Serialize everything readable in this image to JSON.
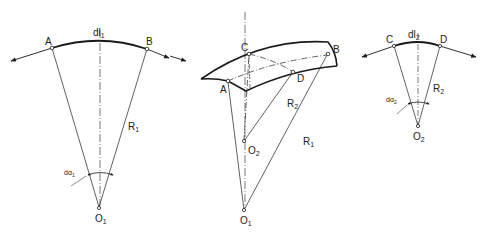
{
  "diagram": {
    "colors": {
      "line": "#3a3a3a",
      "bold": "#1a1a1a",
      "background": "#ffffff"
    },
    "left_figure": {
      "points": {
        "A": "A",
        "B": "B",
        "O": "O",
        "O_sub": "1"
      },
      "arc_label": "dl",
      "arc_label_sub": "1",
      "radius_label": "R",
      "radius_label_sub": "1",
      "angle_label": "dα",
      "angle_label_sub": "1"
    },
    "middle_figure": {
      "points": {
        "A": "A",
        "B": "B",
        "C": "C",
        "D": "D",
        "O1": "O",
        "O1_sub": "1",
        "O2": "O",
        "O2_sub": "2"
      },
      "radius1_label": "R",
      "radius1_label_sub": "1",
      "radius2_label": "R",
      "radius2_label_sub": "2"
    },
    "right_figure": {
      "points": {
        "C": "C",
        "D": "D",
        "O": "O",
        "O_sub": "2"
      },
      "arc_label": "dl",
      "arc_label_sub": "2",
      "radius_label": "R",
      "radius_label_sub": "2",
      "angle_label": "dα",
      "angle_label_sub": "2"
    }
  }
}
